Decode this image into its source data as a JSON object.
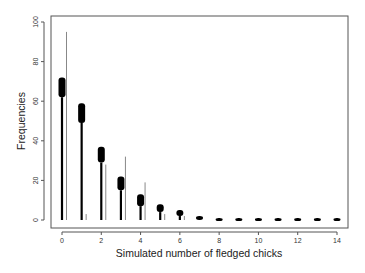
{
  "chart_data": {
    "type": "bar",
    "title": "",
    "xlabel": "Simulated number of fledged chicks",
    "ylabel": "Frequencies",
    "xlim": [
      0,
      14
    ],
    "ylim": [
      0,
      100
    ],
    "x_ticks": [
      0,
      2,
      4,
      6,
      8,
      10,
      12,
      14
    ],
    "y_ticks": [
      0,
      20,
      40,
      60,
      80,
      100
    ],
    "grid": false,
    "legend": null,
    "categories": [
      0,
      1,
      2,
      3,
      4,
      5,
      6,
      7,
      8,
      9,
      10,
      11,
      12,
      13,
      14
    ],
    "series": [
      {
        "name": "Simulated frequency range (thick black)",
        "color": "#000000",
        "lower": [
          62,
          49,
          29,
          15,
          7,
          4,
          2,
          0,
          0,
          0,
          0,
          0,
          0,
          0,
          0
        ],
        "upper": [
          72,
          59,
          37,
          22,
          13,
          8,
          5,
          2,
          1,
          1,
          1,
          1,
          1,
          1,
          1
        ]
      },
      {
        "name": "Observed frequency (thin gray)",
        "color": "#888888",
        "values": [
          95,
          3,
          28,
          32,
          19,
          3,
          2,
          0,
          0,
          0,
          0,
          0,
          0,
          0,
          0
        ]
      }
    ]
  }
}
